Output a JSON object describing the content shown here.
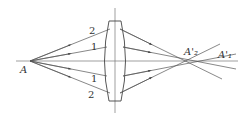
{
  "diagram": {
    "object_point": "A",
    "ray_labels": {
      "outer": "2",
      "inner": "1"
    },
    "image_points": {
      "outer": "A'₂",
      "inner": "A'₁"
    },
    "colors": {
      "line": "#555555",
      "text": "#333333"
    }
  }
}
